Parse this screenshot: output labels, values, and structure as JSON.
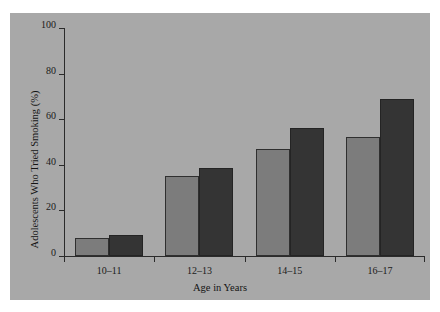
{
  "figure": {
    "background_color": "#ffffff",
    "panel_color": "#a8a8a8",
    "axis_color": "#2b2b2b"
  },
  "chart_data": {
    "type": "bar",
    "title": "",
    "xlabel": "Age in Years",
    "ylabel": "Adolescents Who Tried Smoking (%)",
    "categories": [
      "10–11",
      "12–13",
      "14–15",
      "16–17"
    ],
    "series": [
      {
        "name": "Series 1",
        "color": "#7c7c7c",
        "values": [
          8,
          35,
          47,
          52
        ]
      },
      {
        "name": "Series 2",
        "color": "#343434",
        "values": [
          9,
          38.5,
          56,
          69
        ]
      }
    ],
    "ylim": [
      0,
      100
    ],
    "yticks": [
      0,
      20,
      40,
      60,
      80,
      100
    ],
    "ytick_labels": [
      "0",
      "20",
      "40",
      "60",
      "80",
      "100"
    ],
    "grid": false,
    "legend": null,
    "legend_position": "none"
  }
}
